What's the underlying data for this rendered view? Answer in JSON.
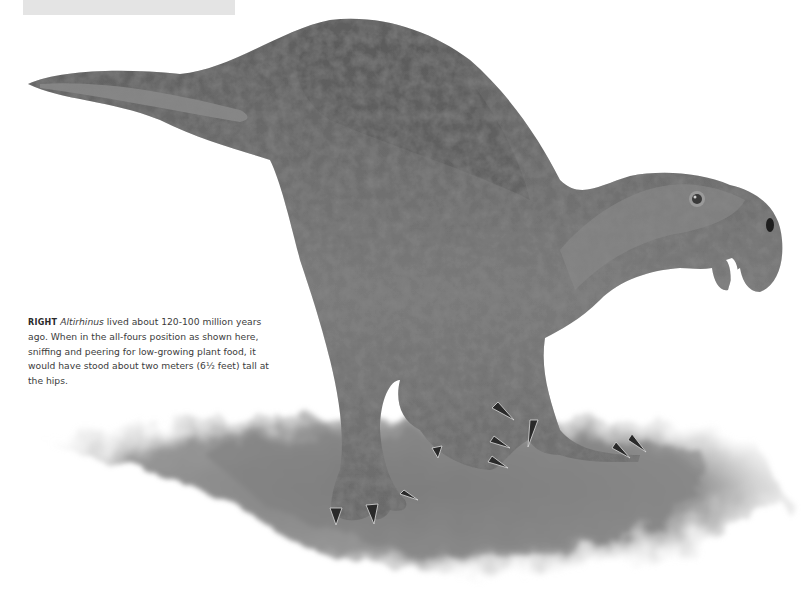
{
  "page": {
    "header_bar_color": "#e4e4e4",
    "background": "#ffffff"
  },
  "illustration": {
    "subject": "Altirhinus dinosaur in all-fours position sniffing the ground",
    "style": "grayscale pencil/painting illustration",
    "body_color": "#6e6e6e",
    "shadow_color": "#8a8a8a"
  },
  "caption": {
    "lead": "RIGHT",
    "genus": "Altirhinus",
    "text": " lived about 120-100 million years ago. When in the all-fours position as shown here, sniffing and peering for low-growing plant food, it would have stood about two meters (6½ feet) tall at the hips."
  }
}
